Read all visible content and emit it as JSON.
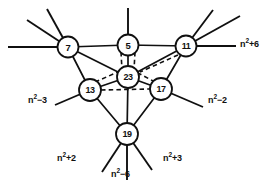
{
  "diagram": {
    "background_color": "#ffffff",
    "stroke_color": "#101010",
    "width": 279,
    "height": 189,
    "nodes": [
      {
        "id": "n7",
        "label": "7",
        "cx": 68,
        "cy": 47,
        "r": 10.5
      },
      {
        "id": "n5",
        "label": "5",
        "cx": 128,
        "cy": 45,
        "r": 10.5
      },
      {
        "id": "n11",
        "label": "11",
        "cx": 186,
        "cy": 46,
        "r": 10.5
      },
      {
        "id": "n23",
        "label": "23",
        "cx": 128,
        "cy": 77,
        "r": 11.0
      },
      {
        "id": "n13",
        "label": "13",
        "cx": 90,
        "cy": 90,
        "r": 11.0
      },
      {
        "id": "n17",
        "label": "17",
        "cx": 161,
        "cy": 89,
        "r": 11.0
      },
      {
        "id": "n19",
        "label": "19",
        "cx": 127,
        "cy": 134,
        "r": 11.0
      }
    ],
    "edges_solid": [
      {
        "from": "n7",
        "to": "n5"
      },
      {
        "from": "n5",
        "to": "n11"
      },
      {
        "from": "n7",
        "to": "n13"
      },
      {
        "from": "n7",
        "to": "n23"
      },
      {
        "from": "n11",
        "to": "n17"
      },
      {
        "from": "n11",
        "to": "n23"
      },
      {
        "from": "n13",
        "to": "n19"
      },
      {
        "from": "n17",
        "to": "n19"
      },
      {
        "from": "n13",
        "to": "n23"
      },
      {
        "from": "n17",
        "to": "n23"
      },
      {
        "from": "n5",
        "to": "n23"
      },
      {
        "from": "n23",
        "to": "n19"
      }
    ],
    "edges_dashed": [
      {
        "from": "n5",
        "to": "n23"
      },
      {
        "from": "n11",
        "to": "n23"
      },
      {
        "from": "n13",
        "to": "n23"
      },
      {
        "from": "n17",
        "to": "n23"
      },
      {
        "from": "n13",
        "to": "n17"
      }
    ],
    "rays": [
      {
        "node": "n7",
        "name": "ray-7-upleft-a"
      },
      {
        "node": "n7",
        "name": "ray-7-upleft-b"
      },
      {
        "node": "n7",
        "name": "ray-7-left"
      },
      {
        "node": "n11",
        "name": "ray-11-upright-a"
      },
      {
        "node": "n11",
        "name": "ray-11-upright-b"
      },
      {
        "node": "n11",
        "name": "ray-11-right"
      },
      {
        "node": "n5",
        "name": "ray-5-up"
      },
      {
        "node": "n13",
        "name": "ray-13-downleft"
      },
      {
        "node": "n17",
        "name": "ray-17-downright"
      },
      {
        "node": "n19",
        "name": "ray-19-downleft"
      },
      {
        "node": "n19",
        "name": "ray-19-down"
      },
      {
        "node": "n19",
        "name": "ray-19-downright"
      }
    ],
    "external_labels": [
      {
        "id": "lbl-n2-plus-6",
        "base": "n",
        "exp": "2",
        "suffix": "+6",
        "x": 240,
        "y": 44,
        "ray": "ray-11-right"
      },
      {
        "id": "lbl-n2-minus-3",
        "base": "n",
        "exp": "2",
        "suffix": "−3",
        "x": 28,
        "y": 100,
        "ray": "ray-13-downleft"
      },
      {
        "id": "lbl-n2-minus-2",
        "base": "n",
        "exp": "2",
        "suffix": "−2",
        "x": 208,
        "y": 100,
        "ray": "ray-17-downright"
      },
      {
        "id": "lbl-n2-plus-2",
        "base": "n",
        "exp": "2",
        "suffix": "+2",
        "x": 57,
        "y": 158,
        "ray": "ray-19-downleft"
      },
      {
        "id": "lbl-n2-minus-6",
        "base": "n",
        "exp": "2",
        "suffix": "−6",
        "x": 113,
        "y": 172,
        "ray": "ray-19-down"
      },
      {
        "id": "lbl-n2-plus-3",
        "base": "n",
        "exp": "2",
        "suffix": "+3",
        "x": 163,
        "y": 158,
        "ray": "ray-19-downright"
      }
    ]
  }
}
